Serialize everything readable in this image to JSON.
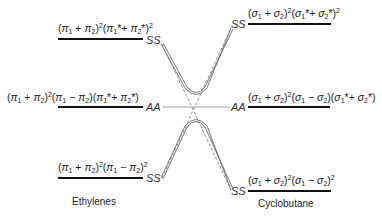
{
  "diagram": {
    "left_column": {
      "caption": "Ethylenes",
      "levels": [
        {
          "id": "top",
          "configuration": "(π1 + π2)²(π1* + π2*)²",
          "symmetry": "SS"
        },
        {
          "id": "middle",
          "configuration": "(π1 + π2)²(π1 − π2)(π1* + π2*)",
          "symmetry": "AA"
        },
        {
          "id": "bottom",
          "configuration": "(π1 + π2)²(π1 − π2)²",
          "symmetry": "SS"
        }
      ]
    },
    "right_column": {
      "caption": "Cyclobutane",
      "levels": [
        {
          "id": "top",
          "configuration": "(σ1 + σ2)²(σ1* + σ2*)²",
          "symmetry": "SS"
        },
        {
          "id": "middle",
          "configuration": "(σ1 + σ2)²(σ1 − σ2)(σ1* + σ2*)",
          "symmetry": "AA"
        },
        {
          "id": "bottom",
          "configuration": "(σ1 + σ2)²(σ1 − σ2)²",
          "symmetry": "SS"
        }
      ]
    },
    "correlations": [
      {
        "from": "left.top SS",
        "to": "right.bottom SS",
        "style": "avoided crossing (dashed)"
      },
      {
        "from": "left.bottom SS",
        "to": "right.top SS",
        "style": "avoided crossing (dashed)"
      },
      {
        "from": "left.middle AA",
        "to": "right.middle AA",
        "style": "thin line"
      }
    ],
    "symbols": {
      "ss": "SS",
      "aa": "AA"
    }
  }
}
